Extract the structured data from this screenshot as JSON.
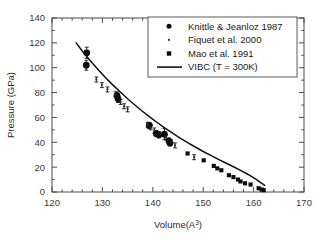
{
  "chart_data": {
    "type": "scatter",
    "title": "",
    "xlabel": "Volume(A³)",
    "xlabel_base": "Volume(A",
    "xlabel_sup": "3",
    "xlabel_close": ")",
    "ylabel": "Pressure (GPa)",
    "xlim": [
      120,
      170
    ],
    "ylim": [
      0,
      140
    ],
    "xticks": [
      120,
      130,
      140,
      150,
      160,
      170
    ],
    "yticks": [
      0,
      20,
      40,
      60,
      80,
      100,
      120,
      140
    ],
    "x_minor_step": 2,
    "y_minor_step": 10,
    "grid": false,
    "legend_position": "top-right",
    "series": [
      {
        "name": "Knittle & Jeanloz 1987",
        "marker": "filled-circle",
        "marker_size": 3.4,
        "has_errorbars": true,
        "points": [
          {
            "x": 126.9,
            "y": 112.0,
            "yerr": 4.5
          },
          {
            "x": 126.8,
            "y": 102.0,
            "yerr": 4.0
          },
          {
            "x": 132.9,
            "y": 77.5,
            "yerr": 3.0
          },
          {
            "x": 133.1,
            "y": 75.0,
            "yerr": 3.0
          },
          {
            "x": 139.3,
            "y": 53.5,
            "yerr": 2.5
          },
          {
            "x": 140.7,
            "y": 47.0,
            "yerr": 2.5
          },
          {
            "x": 141.2,
            "y": 46.0,
            "yerr": 2.5
          },
          {
            "x": 142.3,
            "y": 46.5,
            "yerr": 4.5
          },
          {
            "x": 143.2,
            "y": 41.0,
            "yerr": 2.5
          },
          {
            "x": 143.4,
            "y": 39.5,
            "yerr": 2.5
          }
        ]
      },
      {
        "name": "Fiquet et al. 2000",
        "marker": "small-dot",
        "marker_size": 1.1,
        "has_errorbars": true,
        "points": [
          {
            "x": 128.8,
            "y": 90.5,
            "yerr": 2.0
          },
          {
            "x": 129.9,
            "y": 86.0,
            "yerr": 2.0
          },
          {
            "x": 131.0,
            "y": 82.5,
            "yerr": 2.0
          },
          {
            "x": 132.6,
            "y": 78.5,
            "yerr": 2.0
          },
          {
            "x": 133.6,
            "y": 72.5,
            "yerr": 2.0
          },
          {
            "x": 134.3,
            "y": 69.0,
            "yerr": 2.0
          },
          {
            "x": 135.0,
            "y": 66.5,
            "yerr": 2.0
          },
          {
            "x": 139.0,
            "y": 54.0,
            "yerr": 2.0
          },
          {
            "x": 139.6,
            "y": 52.0,
            "yerr": 2.0
          },
          {
            "x": 140.3,
            "y": 49.5,
            "yerr": 2.0
          },
          {
            "x": 142.6,
            "y": 44.0,
            "yerr": 2.0
          },
          {
            "x": 143.6,
            "y": 40.0,
            "yerr": 2.0
          },
          {
            "x": 144.4,
            "y": 37.5,
            "yerr": 2.0
          },
          {
            "x": 148.2,
            "y": 28.0,
            "yerr": 2.0
          }
        ]
      },
      {
        "name": "Mao et al. 1991",
        "marker": "filled-square",
        "marker_size": 3.0,
        "has_errorbars": false,
        "points": [
          {
            "x": 146.9,
            "y": 31.0
          },
          {
            "x": 150.1,
            "y": 25.5
          },
          {
            "x": 152.1,
            "y": 21.0
          },
          {
            "x": 152.8,
            "y": 19.0
          },
          {
            "x": 153.6,
            "y": 17.5
          },
          {
            "x": 155.1,
            "y": 13.5
          },
          {
            "x": 156.0,
            "y": 12.0
          },
          {
            "x": 156.9,
            "y": 10.0
          },
          {
            "x": 157.4,
            "y": 8.5
          },
          {
            "x": 158.3,
            "y": 7.0
          },
          {
            "x": 159.4,
            "y": 6.0
          },
          {
            "x": 161.0,
            "y": 3.0
          },
          {
            "x": 161.6,
            "y": 2.0
          },
          {
            "x": 162.0,
            "y": 1.5
          }
        ]
      }
    ],
    "model": {
      "name": "VIBC (T = 300K)",
      "style": "solid-line",
      "x": [
        124.8,
        126.0,
        127.5,
        129.0,
        130.5,
        132.0,
        133.5,
        135.0,
        136.5,
        138.0,
        139.5,
        141.0,
        142.5,
        144.0,
        145.5,
        147.0,
        148.5,
        150.0,
        151.5,
        153.0,
        154.5,
        156.0,
        157.5,
        159.0,
        160.5,
        162.2
      ],
      "y": [
        120.0,
        113.5,
        106.0,
        99.2,
        92.6,
        86.4,
        80.6,
        75.0,
        69.8,
        64.8,
        60.0,
        55.5,
        51.2,
        47.1,
        43.2,
        39.5,
        36.0,
        32.6,
        29.4,
        26.3,
        23.3,
        20.3,
        17.2,
        13.9,
        10.2,
        5.3
      ]
    },
    "legend_entries": [
      {
        "label": "Knittle & Jeanloz 1987",
        "marker": "filled-circle"
      },
      {
        "label": "Fiquet et al. 2000",
        "marker": "small-dot"
      },
      {
        "label": "Mao et al. 1991",
        "marker": "filled-square"
      },
      {
        "label": "VIBC (T = 300K)",
        "marker": "line"
      }
    ],
    "colors": {
      "data": "#0d0d0d",
      "curve": "#101010",
      "axis": "#4a4a4a",
      "background": "#ffffff"
    }
  }
}
